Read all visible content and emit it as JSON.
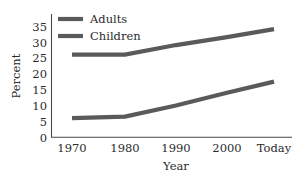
{
  "chart_data": {
    "type": "line",
    "title": "",
    "subtitle": "",
    "xlabel": "Year",
    "ylabel": "Percent",
    "categories": [
      "1970",
      "1980",
      "1990",
      "2000",
      "Today"
    ],
    "x_tick_labels": [
      "1970",
      "1980",
      "1990",
      "2000",
      "Today"
    ],
    "y_tick_labels": [
      "0",
      "5",
      "10",
      "15",
      "20",
      "25",
      "30",
      "35"
    ],
    "y_ticks": [
      0,
      5,
      10,
      15,
      20,
      25,
      30,
      35
    ],
    "ylim": [
      0,
      35
    ],
    "grid": false,
    "legend_position": "top-left-inside",
    "series": [
      {
        "name": "Adults",
        "color": "#5a5a5a",
        "values": [
          26,
          26,
          29,
          31.5,
          34
        ]
      },
      {
        "name": "Children",
        "color": "#5a5a5a",
        "values": [
          6,
          6.5,
          10,
          14,
          17.5
        ]
      }
    ],
    "legend_entries": [
      {
        "label": "Adults",
        "color": "#5a5a5a"
      },
      {
        "label": "Children",
        "color": "#5a5a5a"
      }
    ],
    "annotations": []
  },
  "axes": {
    "y_axis_name": "percent-axis",
    "x_axis_name": "year-axis",
    "axis_color": "#4a4a4a"
  },
  "figure": {
    "background_color": "#ffffff",
    "text_color": "#2b2b2b"
  }
}
